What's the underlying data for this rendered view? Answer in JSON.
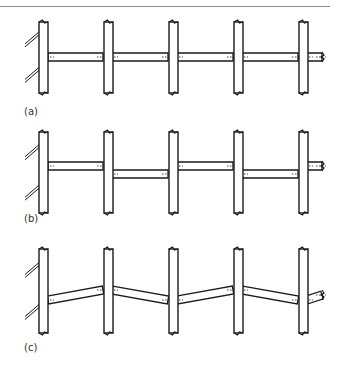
{
  "figure": {
    "panels": [
      {
        "label": "(a)",
        "label_pos": [
          24,
          114
        ],
        "post_top": 22,
        "post_bottom": 93,
        "beam_type": "continuous-level",
        "beams": [
          {
            "x1": 48,
            "y1": 57,
            "x2": 103,
            "y2": 57
          },
          {
            "x1": 112,
            "y1": 57,
            "x2": 168,
            "y2": 57
          },
          {
            "x1": 177,
            "y1": 57,
            "x2": 233,
            "y2": 57
          },
          {
            "x1": 242,
            "y1": 57,
            "x2": 298,
            "y2": 57
          },
          {
            "x1": 307,
            "y1": 57,
            "x2": 322,
            "y2": 57
          }
        ]
      },
      {
        "label": "(b)",
        "label_pos": [
          24,
          221
        ],
        "post_top": 132,
        "post_bottom": 213,
        "beam_type": "staggered",
        "beams": [
          {
            "x1": 48,
            "y1": 166,
            "x2": 103,
            "y2": 166
          },
          {
            "x1": 112,
            "y1": 174,
            "x2": 168,
            "y2": 174
          },
          {
            "x1": 177,
            "y1": 166,
            "x2": 233,
            "y2": 166
          },
          {
            "x1": 242,
            "y1": 174,
            "x2": 298,
            "y2": 174
          },
          {
            "x1": 307,
            "y1": 166,
            "x2": 322,
            "y2": 166
          }
        ]
      },
      {
        "label": "(c)",
        "label_pos": [
          24,
          350
        ],
        "post_top": 249,
        "post_bottom": 333,
        "beam_type": "zigzag",
        "beams": [
          {
            "x1": 48,
            "y1": 300,
            "x2": 103,
            "y2": 290
          },
          {
            "x1": 112,
            "y1": 290,
            "x2": 168,
            "y2": 300
          },
          {
            "x1": 177,
            "y1": 300,
            "x2": 233,
            "y2": 290
          },
          {
            "x1": 242,
            "y1": 290,
            "x2": 298,
            "y2": 300
          },
          {
            "x1": 307,
            "y1": 300,
            "x2": 322,
            "y2": 295
          }
        ]
      }
    ],
    "post_x": [
      39,
      104,
      169,
      234,
      299
    ],
    "post_width": 9,
    "beam_thickness": 8,
    "stroke_color": "#1a1a1a",
    "label_color": "#333333"
  }
}
